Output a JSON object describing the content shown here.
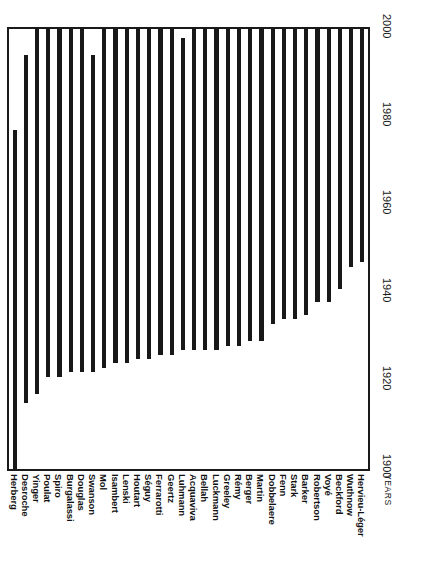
{
  "chart_data": {
    "type": "bar",
    "orientation": "vertical-rotated",
    "title": "",
    "subtitle": "",
    "xlabel": "YEARS",
    "ylabel": "",
    "xlim": [
      1900,
      2000
    ],
    "grid": false,
    "legend": null,
    "axis": {
      "name": "YEARS",
      "ticks": [
        1900,
        1920,
        1940,
        1960,
        1980,
        2000
      ],
      "tick_labels": [
        "1900",
        "1920",
        "1940",
        "1960",
        "1980",
        "2000"
      ],
      "min": 1900,
      "max": 2000
    },
    "bar_color": "#181818",
    "frame_color": "#1a1a1a",
    "categories": [
      "Herberg",
      "Desroche",
      "Yinger",
      "Poulat",
      "Spiro",
      "Burgalassi",
      "Douglas",
      "Swanson",
      "Mol",
      "Isambert",
      "Lenski",
      "Houtart",
      "Séguy",
      "Ferrarotti",
      "Geertz",
      "Luhmann",
      "Acquaviva",
      "Bellah",
      "Luckmann",
      "Greeley",
      "Rémy",
      "Berger",
      "Martin",
      "Dobbelaere",
      "Fenn",
      "Stark",
      "Barker",
      "Robertson",
      "Voyé",
      "Beckford",
      "Wuthnow",
      "Hervieu-Léger"
    ],
    "series": [
      {
        "name": "Span",
        "spans": [
          {
            "category": "Herberg",
            "start": 1900,
            "end": 1977
          },
          {
            "category": "Desroche",
            "start": 1915,
            "end": 1994
          },
          {
            "category": "Yinger",
            "start": 1917,
            "end": 2000
          },
          {
            "category": "Poulat",
            "start": 1921,
            "end": 2000
          },
          {
            "category": "Spiro",
            "start": 1921,
            "end": 2000
          },
          {
            "category": "Burgalassi",
            "start": 1922,
            "end": 2000
          },
          {
            "category": "Douglas",
            "start": 1922,
            "end": 2000
          },
          {
            "category": "Swanson",
            "start": 1922,
            "end": 1994
          },
          {
            "category": "Mol",
            "start": 1923,
            "end": 2000
          },
          {
            "category": "Isambert",
            "start": 1924,
            "end": 2000
          },
          {
            "category": "Lenski",
            "start": 1924,
            "end": 2000
          },
          {
            "category": "Houtart",
            "start": 1925,
            "end": 2000
          },
          {
            "category": "Séguy",
            "start": 1925,
            "end": 2000
          },
          {
            "category": "Ferrarotti",
            "start": 1926,
            "end": 2000
          },
          {
            "category": "Geertz",
            "start": 1926,
            "end": 2000
          },
          {
            "category": "Luhmann",
            "start": 1927,
            "end": 1998
          },
          {
            "category": "Acquaviva",
            "start": 1927,
            "end": 2000
          },
          {
            "category": "Bellah",
            "start": 1927,
            "end": 2000
          },
          {
            "category": "Luckmann",
            "start": 1927,
            "end": 2000
          },
          {
            "category": "Greeley",
            "start": 1928,
            "end": 2000
          },
          {
            "category": "Rémy",
            "start": 1928,
            "end": 2000
          },
          {
            "category": "Berger",
            "start": 1929,
            "end": 2000
          },
          {
            "category": "Martin",
            "start": 1929,
            "end": 2000
          },
          {
            "category": "Dobbelaere",
            "start": 1933,
            "end": 2000
          },
          {
            "category": "Fenn",
            "start": 1934,
            "end": 2000
          },
          {
            "category": "Stark",
            "start": 1934,
            "end": 2000
          },
          {
            "category": "Barker",
            "start": 1935,
            "end": 2000
          },
          {
            "category": "Robertson",
            "start": 1938,
            "end": 2000
          },
          {
            "category": "Voyé",
            "start": 1938,
            "end": 2000
          },
          {
            "category": "Beckford",
            "start": 1941,
            "end": 2000
          },
          {
            "category": "Wuthnow",
            "start": 1946,
            "end": 2000
          },
          {
            "category": "Hervieu-Léger",
            "start": 1947,
            "end": 2000
          }
        ]
      }
    ]
  }
}
